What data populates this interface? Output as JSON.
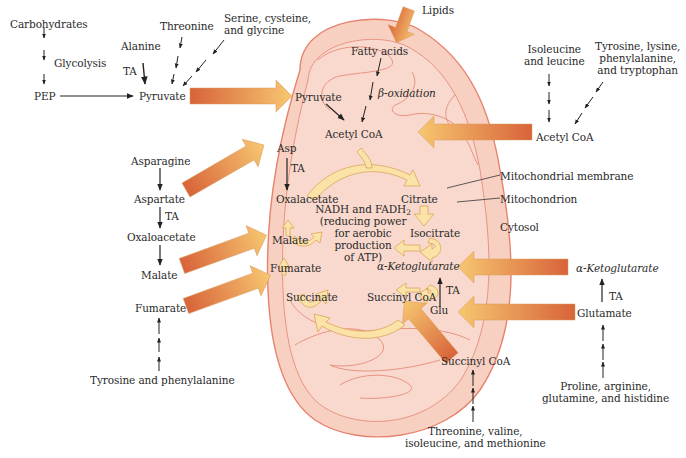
{
  "diagram": {
    "type": "metabolic-pathway",
    "colors": {
      "mitochondrion_fill": "#f7c9bb",
      "mitochondrion_outline": "#e98a78",
      "inner_fold_line": "#e79482",
      "cycle_arrow_fill": "#fbe3a8",
      "cycle_arrow_outline": "#d9a45a",
      "transport_arrow_start": "#dc6a3c",
      "transport_arrow_end": "#f6c46e",
      "text": "#2a2a2a"
    },
    "cytosol": {
      "carbohydrates": "Carbohydrates",
      "glycolysis": "Glycolysis",
      "pep": "PEP",
      "alanine": "Alanine",
      "ta_alanine": "TA",
      "threonine": "Threonine",
      "serine_group": "Serine, cysteine,\nand glycine",
      "pyruvate": "Pyruvate",
      "lipids": "Lipids",
      "isoleucine_leucine": "Isoleucine\nand leucine",
      "tyrosine_group": "Tyrosine, lysine,\nphenylalanine,\nand tryptophan",
      "acetyl_coa": "Acetyl CoA",
      "asparagine": "Asparagine",
      "aspartate": "Aspartate",
      "ta_aspartate": "TA",
      "oxaloacetate": "Oxaloacetate",
      "malate": "Malate",
      "fumarate": "Fumarate",
      "tyrosine_phenylalanine": "Tyrosine and phenylalanine",
      "alpha_ketoglutarate": "α-Ketoglutarate",
      "ta_glutamate": "TA",
      "glutamate": "Glutamate",
      "proline_group": "Proline, arginine,\nglutamine, and histidine",
      "succinyl_coa": "Succinyl CoA",
      "threonine_group": "Threonine, valine,\nisoleucine, and methionine",
      "cytosol_label": "Cytosol"
    },
    "mitochondrion": {
      "fatty_acids": "Fatty acids",
      "beta_oxidation": "β-oxidation",
      "pyruvate": "Pyruvate",
      "acetyl_coa": "Acetyl CoA",
      "asp": "Asp",
      "ta_asp": "TA",
      "oxalacetate": "Oxalacetate",
      "citrate": "Citrate",
      "isocitrate": "Isocitrate",
      "alpha_ketoglutarate": "α-Ketoglutarate",
      "succinyl_coa": "Succinyl CoA",
      "succinate": "Succinate",
      "fumarate": "Fumarate",
      "malate": "Malate",
      "glu": "Glu",
      "ta_glu": "TA",
      "center_note_line1": "NADH and FADH",
      "center_note_sub": "2",
      "center_note_rest": "(reducing power\nfor aerobic\nproduction\nof ATP)"
    },
    "callouts": {
      "membrane": "Mitochondrial membrane",
      "mitochondrion": "Mitochondrion"
    }
  }
}
